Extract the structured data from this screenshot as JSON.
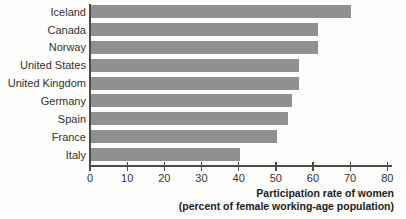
{
  "figure": {
    "background": "#fdfdfb",
    "bar_color": "#909090",
    "axis_color": "#4b4b4b",
    "label_color": "#323232",
    "title_color": "#1c1c1c"
  },
  "chart_data": {
    "type": "bar",
    "orientation": "horizontal",
    "categories": [
      "Iceland",
      "Canada",
      "Norway",
      "United States",
      "United Kingdom",
      "Germany",
      "Spain",
      "France",
      "Italy"
    ],
    "values": [
      70,
      61,
      61,
      56,
      56,
      54,
      53,
      50,
      40
    ],
    "xlabel_line1": "Participation rate of women",
    "xlabel_line2": "(percent of female working-age population)",
    "xlim": [
      0,
      80
    ],
    "xticks": [
      0,
      10,
      20,
      30,
      40,
      50,
      60,
      70,
      80
    ],
    "grid": false,
    "legend": "none"
  }
}
